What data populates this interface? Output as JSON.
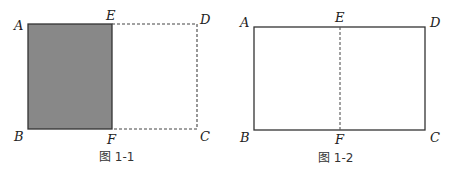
{
  "figures": [
    {
      "caption": "图 1-1",
      "labels": {
        "A": "A",
        "B": "B",
        "C": "C",
        "D": "D",
        "E": "E",
        "F": "F"
      },
      "shaded_region": "ABFE",
      "solid_edges": [
        "AE",
        "EF",
        "FB",
        "BA"
      ],
      "dashed_edges": [
        "ED",
        "DC",
        "CF"
      ]
    },
    {
      "caption": "图 1-2",
      "labels": {
        "A": "A",
        "B": "B",
        "C": "C",
        "D": "D",
        "E": "E",
        "F": "F"
      },
      "solid_edges": [
        "AD",
        "DC",
        "CB",
        "BA"
      ],
      "dashed_edges": [
        "EF"
      ]
    }
  ],
  "colors": {
    "shade": "#888888",
    "line": "#333333"
  }
}
